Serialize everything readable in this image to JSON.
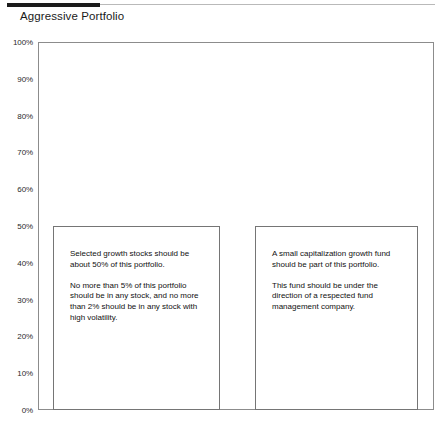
{
  "header": {
    "title": "Aggressive Portfolio"
  },
  "chart_data": {
    "type": "bar",
    "title": "Aggressive Portfolio",
    "xlabel": "",
    "ylabel": "",
    "ylim": [
      0,
      100
    ],
    "grid": false,
    "legend": "none",
    "y_tick_labels": [
      "100%",
      "90%",
      "80%",
      "70%",
      "60%",
      "50%",
      "40%",
      "30%",
      "20%",
      "10%",
      "0%"
    ],
    "y_tick_values": [
      100,
      90,
      80,
      70,
      60,
      50,
      40,
      30,
      20,
      10,
      0
    ],
    "categories": [
      "Selected growth stocks",
      "Small capitalization growth fund"
    ],
    "values": [
      50,
      50
    ],
    "annotations": [
      {
        "bar_index": 0,
        "paragraphs": [
          "Selected growth stocks should be about 50% of this portfolio.",
          "No more than 5% of this portfolio should be in any stock, and no more than 2% should be in any stock with high volatility."
        ]
      },
      {
        "bar_index": 1,
        "paragraphs": [
          "A small capitalization growth fund should be part of this portfolio.",
          "This fund should be under the direction of a respected fund management company."
        ]
      }
    ]
  },
  "colors": {
    "rule_dark": "#1b1b1b",
    "rule_light": "#b9b9b9",
    "plot_border": "#8c8c8c",
    "bar_border": "#757575",
    "text": "#111111",
    "background": "#ffffff"
  }
}
